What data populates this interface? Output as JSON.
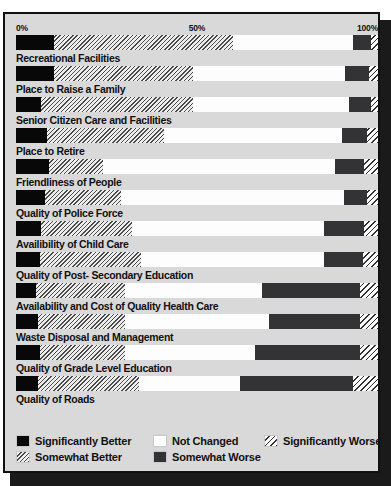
{
  "chart_data": {
    "type": "bar",
    "subtype": "stacked-horizontal-100pct",
    "title": "",
    "xlabel": "",
    "ylabel": "",
    "xlim": [
      0,
      100
    ],
    "grid": false,
    "legend_position": "bottom",
    "axis_ticks": [
      "0%",
      "50%",
      "100%"
    ],
    "series": [
      {
        "name": "Significantly Better",
        "key": "sig_better",
        "swatch": "solid-black",
        "color": "#080808",
        "values": [
          10.5,
          10.5,
          7.0,
          8.5,
          9.0,
          8.0,
          7.0,
          6.5,
          5.5,
          6.0,
          6.5,
          6.0
        ]
      },
      {
        "name": "Somewhat  Better",
        "key": "som_better",
        "swatch": "light-diagonal-hatch",
        "color": "#ededed",
        "values": [
          49.5,
          38.5,
          42.0,
          32.5,
          15.0,
          21.0,
          25.0,
          28.0,
          24.5,
          24.0,
          23.5,
          28.0
        ]
      },
      {
        "name": "Not Changed",
        "key": "not_changed",
        "swatch": "solid-white",
        "color": "#fdfdfd",
        "values": [
          33.0,
          42.0,
          43.0,
          49.0,
          64.0,
          61.5,
          53.0,
          50.5,
          38.0,
          40.0,
          36.0,
          28.0
        ]
      },
      {
        "name": "Somewhat Worse",
        "key": "som_worse",
        "swatch": "solid-dark-gray",
        "color": "#333336",
        "values": [
          5.0,
          6.5,
          6.0,
          7.0,
          8.0,
          6.5,
          11.0,
          11.0,
          27.0,
          25.0,
          29.0,
          31.0
        ]
      },
      {
        "name": "Significantly Worse",
        "key": "sig_worse",
        "swatch": "sparse-diagonal-hatch",
        "color": "#f0f0f0",
        "values": [
          2.0,
          2.5,
          2.0,
          3.0,
          4.0,
          3.0,
          4.0,
          4.0,
          5.0,
          5.0,
          5.0,
          7.0
        ]
      }
    ],
    "categories": [
      "Recreational Facilities",
      "Place to Raise a Family",
      "Senior Citizen Care and Facilities",
      "Place to Retire",
      "Friendliness of People",
      "Quality of Police Force",
      "Availibility of Child Care",
      "Quality of Post- Secondary Education",
      "Availability and Cost of Quality Health Care",
      "Waste Disposal and Management",
      "Quality of Grade Level Education",
      "Quality of Roads"
    ]
  },
  "legend": {
    "row1": [
      {
        "label": "Significantly Better",
        "swatch_class": "seg-sig-better"
      },
      {
        "label": "Not Changed",
        "swatch_class": "seg-not-changed"
      },
      {
        "label": "Significantly Worse",
        "swatch_class": "seg-sig-worse"
      }
    ],
    "row2": [
      {
        "label": "Somewhat  Better",
        "swatch_class": "seg-som-better"
      },
      {
        "label": "Somewhat Worse",
        "swatch_class": "seg-som-worse"
      }
    ]
  }
}
